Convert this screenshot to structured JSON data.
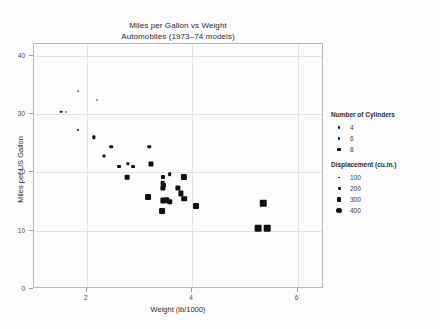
{
  "chart_data": {
    "type": "scatter",
    "title": "Miles per Gallon vs Weight",
    "subtitle": "Automobiles (1973–74 models)",
    "xlabel": "Weight (lb/1000)",
    "ylabel": "Miles per US Gallon",
    "xlim": [
      1.0,
      6.5
    ],
    "ylim": [
      0,
      42
    ],
    "xticks": [
      2,
      4,
      6
    ],
    "yticks": [
      0,
      10,
      20,
      30,
      40
    ],
    "grid": true,
    "size_encoding": "Displacement (cu.in.)",
    "color_encoding": "Number of Cylinders",
    "points": [
      {
        "x": 2.2,
        "y": 32.4,
        "cyl": 4,
        "disp": 78.7
      },
      {
        "x": 1.615,
        "y": 30.4,
        "cyl": 4,
        "disp": 75.7
      },
      {
        "x": 1.835,
        "y": 33.9,
        "cyl": 4,
        "disp": 71.1
      },
      {
        "x": 1.513,
        "y": 30.4,
        "cyl": 4,
        "disp": 95.1
      },
      {
        "x": 2.14,
        "y": 26.0,
        "cyl": 4,
        "disp": 120.3
      },
      {
        "x": 1.835,
        "y": 27.3,
        "cyl": 4,
        "disp": 79.0
      },
      {
        "x": 2.465,
        "y": 24.4,
        "cyl": 4,
        "disp": 146.7
      },
      {
        "x": 2.32,
        "y": 22.8,
        "cyl": 4,
        "disp": 108.0
      },
      {
        "x": 2.78,
        "y": 21.4,
        "cyl": 4,
        "disp": 121.0
      },
      {
        "x": 3.19,
        "y": 24.4,
        "cyl": 4,
        "disp": 140.8
      },
      {
        "x": 2.62,
        "y": 21.0,
        "cyl": 6,
        "disp": 160.0
      },
      {
        "x": 2.875,
        "y": 21.0,
        "cyl": 6,
        "disp": 160.0
      },
      {
        "x": 3.215,
        "y": 21.4,
        "cyl": 6,
        "disp": 258.0
      },
      {
        "x": 3.44,
        "y": 19.2,
        "cyl": 6,
        "disp": 167.6
      },
      {
        "x": 3.46,
        "y": 17.8,
        "cyl": 6,
        "disp": 167.6
      },
      {
        "x": 3.57,
        "y": 19.7,
        "cyl": 6,
        "disp": 145.0
      },
      {
        "x": 2.77,
        "y": 19.2,
        "cyl": 6,
        "disp": 225.0
      },
      {
        "x": 3.44,
        "y": 18.1,
        "cyl": 6,
        "disp": 225.0
      },
      {
        "x": 3.44,
        "y": 17.3,
        "cyl": 8,
        "disp": 275.8
      },
      {
        "x": 3.44,
        "y": 15.2,
        "cyl": 8,
        "disp": 275.8
      },
      {
        "x": 3.57,
        "y": 15.0,
        "cyl": 8,
        "disp": 301.0
      },
      {
        "x": 3.73,
        "y": 17.3,
        "cyl": 8,
        "disp": 275.8
      },
      {
        "x": 3.78,
        "y": 16.4,
        "cyl": 8,
        "disp": 275.8
      },
      {
        "x": 3.845,
        "y": 15.5,
        "cyl": 8,
        "disp": 318.0
      },
      {
        "x": 4.07,
        "y": 14.3,
        "cyl": 8,
        "disp": 360.0
      },
      {
        "x": 3.17,
        "y": 15.8,
        "cyl": 8,
        "disp": 351.0
      },
      {
        "x": 5.25,
        "y": 10.4,
        "cyl": 8,
        "disp": 472.0
      },
      {
        "x": 5.424,
        "y": 10.4,
        "cyl": 8,
        "disp": 460.0
      },
      {
        "x": 5.345,
        "y": 14.7,
        "cyl": 8,
        "disp": 440.0
      },
      {
        "x": 3.52,
        "y": 15.2,
        "cyl": 8,
        "disp": 304.0
      },
      {
        "x": 3.435,
        "y": 13.3,
        "cyl": 8,
        "disp": 350.0
      },
      {
        "x": 3.84,
        "y": 19.2,
        "cyl": 8,
        "disp": 400.0
      }
    ]
  },
  "legends": {
    "cylinders": {
      "title": "Number of Cylinders",
      "items": [
        {
          "label": "4",
          "size": 2.2
        },
        {
          "label": "6",
          "size": 2.8
        },
        {
          "label": "8",
          "size": 3.4
        }
      ]
    },
    "displacement": {
      "title": "Displacement (cu.in.)",
      "items": [
        {
          "label": "100",
          "size": 1.6
        },
        {
          "label": "200",
          "size": 3.0
        },
        {
          "label": "300",
          "size": 4.2
        },
        {
          "label": "400",
          "size": 5.6
        }
      ]
    }
  },
  "colors": {
    "marker": "#111111",
    "frame": "#b9b9b9",
    "grid": "#e2e2e2",
    "text": "#2b2b2b",
    "background": "#fcfcfc"
  }
}
